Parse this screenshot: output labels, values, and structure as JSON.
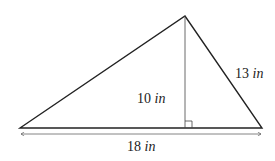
{
  "diagram": {
    "type": "triangle",
    "vertices": {
      "left": [
        20,
        128
      ],
      "apex": [
        185,
        16
      ],
      "right": [
        262,
        128
      ]
    },
    "altitude_foot": [
      185,
      128
    ],
    "labels": {
      "height": {
        "value": "10",
        "unit": "in"
      },
      "side": {
        "value": "13",
        "unit": "in"
      },
      "base": {
        "value": "18",
        "unit": "in"
      }
    },
    "colors": {
      "stroke": "#222222",
      "background": "#ffffff"
    }
  }
}
